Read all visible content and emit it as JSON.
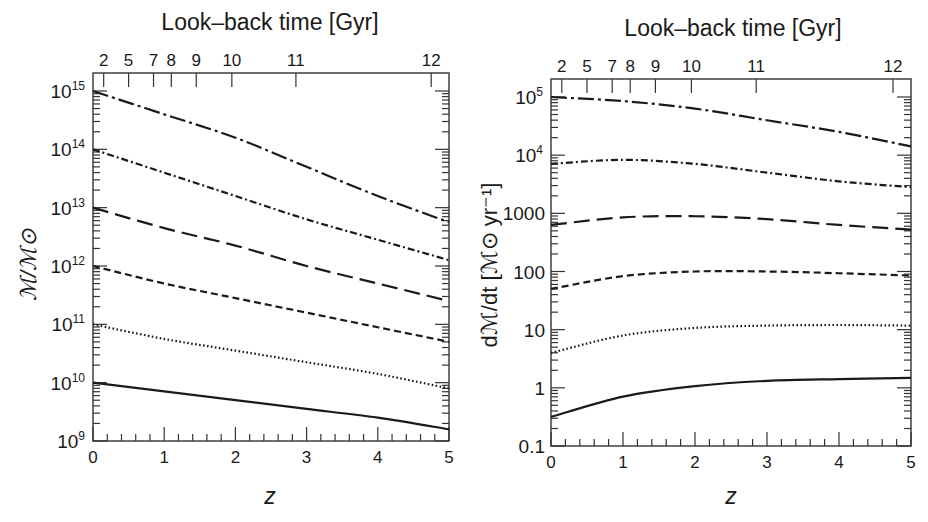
{
  "chart_data": [
    {
      "type": "line",
      "panel": "left",
      "title": "",
      "top_axis_label": "Look–back time [Gyr]",
      "top_axis_ticks": [
        "2",
        "5",
        "7",
        "8",
        "9",
        "10",
        "11",
        "12"
      ],
      "top_axis_tick_z": [
        0.15,
        0.5,
        0.85,
        1.1,
        1.45,
        1.95,
        2.85,
        4.75
      ],
      "xlabel": "z",
      "ylabel": "ℳ/ℳ⊙",
      "x_ticks": [
        "0",
        "1",
        "2",
        "3",
        "4",
        "5"
      ],
      "xlim": [
        0,
        5
      ],
      "yscale": "log",
      "ylim": [
        1000000000.0,
        1000000000000000.0
      ],
      "y_ticks": [
        "10^9",
        "10^10",
        "10^11",
        "10^12",
        "10^13",
        "10^14",
        "10^15"
      ],
      "x": [
        0,
        1,
        2,
        3,
        4,
        5
      ],
      "series": [
        {
          "name": "long-dash-dot",
          "style": "longdashdot",
          "log10_values": [
            15.0,
            14.6,
            14.2,
            13.7,
            13.2,
            12.75
          ]
        },
        {
          "name": "dash-dot",
          "style": "dashdot",
          "log10_values": [
            14.0,
            13.6,
            13.2,
            12.8,
            12.45,
            12.1
          ]
        },
        {
          "name": "long-dash",
          "style": "longdash",
          "log10_values": [
            13.0,
            12.65,
            12.35,
            12.0,
            11.7,
            11.4
          ]
        },
        {
          "name": "short-dash",
          "style": "shortdash",
          "log10_values": [
            12.0,
            11.7,
            11.45,
            11.2,
            10.95,
            10.7
          ]
        },
        {
          "name": "dotted",
          "style": "dotted",
          "log10_values": [
            11.0,
            10.75,
            10.55,
            10.35,
            10.15,
            9.9
          ]
        },
        {
          "name": "solid",
          "style": "solid",
          "log10_values": [
            10.0,
            9.85,
            9.7,
            9.55,
            9.4,
            9.2
          ]
        }
      ],
      "grid": false,
      "legend": "none"
    },
    {
      "type": "line",
      "panel": "right",
      "title": "",
      "top_axis_label": "Look–back time [Gyr]",
      "top_axis_ticks": [
        "2",
        "5",
        "7",
        "8",
        "9",
        "10",
        "11",
        "12"
      ],
      "top_axis_tick_z": [
        0.15,
        0.5,
        0.85,
        1.1,
        1.45,
        1.95,
        2.85,
        4.75
      ],
      "xlabel": "z",
      "ylabel": "dℳ/dt [ℳ⊙ yr⁻¹]",
      "x_ticks": [
        "0",
        "1",
        "2",
        "3",
        "4",
        "5"
      ],
      "xlim": [
        0,
        5
      ],
      "yscale": "log",
      "ylim": [
        0.1,
        100000
      ],
      "y_ticks": [
        "0.1",
        "1",
        "10",
        "100",
        "1000",
        "10^4",
        "10^5"
      ],
      "x": [
        0,
        1,
        2,
        3,
        4,
        5
      ],
      "series": [
        {
          "name": "long-dash-dot",
          "style": "longdashdot",
          "log10_values": [
            5.0,
            4.93,
            4.8,
            4.6,
            4.4,
            4.15
          ]
        },
        {
          "name": "dash-dot",
          "style": "dashdot",
          "log10_values": [
            3.85,
            3.92,
            3.85,
            3.7,
            3.55,
            3.45
          ]
        },
        {
          "name": "long-dash",
          "style": "longdash",
          "log10_values": [
            2.8,
            2.93,
            2.95,
            2.9,
            2.8,
            2.72
          ]
        },
        {
          "name": "short-dash",
          "style": "shortdash",
          "log10_values": [
            1.7,
            1.92,
            2.0,
            2.0,
            1.97,
            1.93
          ]
        },
        {
          "name": "dotted",
          "style": "dotted",
          "log10_values": [
            0.6,
            0.9,
            1.03,
            1.07,
            1.08,
            1.07
          ]
        },
        {
          "name": "solid",
          "style": "solid",
          "log10_values": [
            -0.5,
            -0.15,
            0.03,
            0.12,
            0.15,
            0.17
          ]
        }
      ],
      "grid": false,
      "legend": "none"
    }
  ],
  "left": {
    "top_title": "Look–back time [Gyr]",
    "xlabel": "z",
    "ylabel": "ℳ/ℳ⊙",
    "x_tick_labels": [
      "0",
      "1",
      "2",
      "3",
      "4",
      "5"
    ],
    "y_tick_bases": [
      "10",
      "10",
      "10",
      "10",
      "10",
      "10",
      "10"
    ],
    "y_tick_exps": [
      "9",
      "10",
      "11",
      "12",
      "13",
      "14",
      "15"
    ]
  },
  "right": {
    "top_title": "Look–back time [Gyr]",
    "xlabel": "z",
    "ylabel": "dℳ/dt [ℳ⊙ yr⁻¹]",
    "x_tick_labels": [
      "0",
      "1",
      "2",
      "3",
      "4",
      "5"
    ],
    "y_tick_labels": [
      "0.1",
      "1",
      "10",
      "100",
      "1000",
      "10",
      "10"
    ],
    "y_tick_exps": [
      "",
      "",
      "",
      "",
      "",
      "4",
      "5"
    ]
  },
  "colors": {
    "line": "#1a1a1a",
    "frame": "#333333",
    "background": "#ffffff"
  }
}
